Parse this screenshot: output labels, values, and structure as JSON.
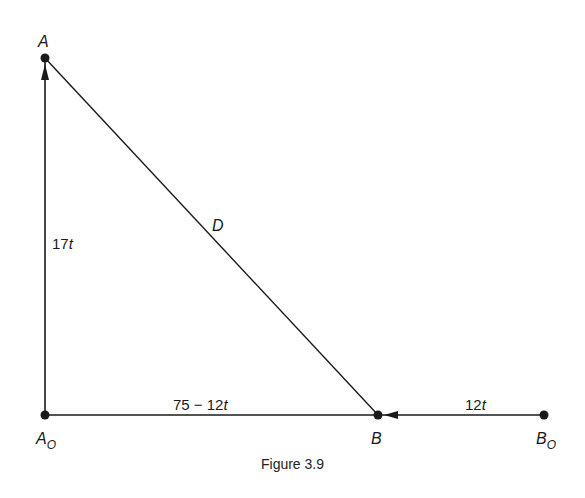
{
  "diagram": {
    "points": {
      "A": {
        "label": "A",
        "sub": ""
      },
      "A0": {
        "label": "A",
        "sub": "O"
      },
      "B": {
        "label": "B",
        "sub": ""
      },
      "B0": {
        "label": "B",
        "sub": "O"
      }
    },
    "edges": {
      "A0_A": {
        "label_num": "17",
        "label_var": "t"
      },
      "A_B": {
        "label": "D"
      },
      "A0_B": {
        "label_num": "75 − 12",
        "label_var": "t"
      },
      "B0_B": {
        "label_num": "12",
        "label_var": "t"
      }
    },
    "caption": "Figure 3.9"
  }
}
